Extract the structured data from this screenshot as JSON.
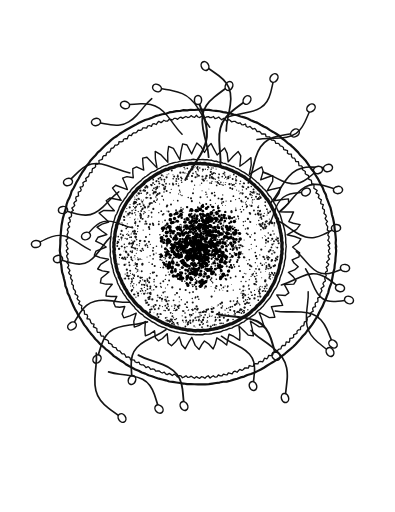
{
  "figure": {
    "kind": "line-drawing",
    "background_color": "#ffffff",
    "ink_color": "#111111",
    "canvas": {
      "width": 395,
      "height": 512
    },
    "caption": ""
  },
  "ovum": {
    "center": {
      "x": 198,
      "y": 247
    },
    "layers": [
      {
        "name": "zona-pellucida-outer-line",
        "label": "zona pellucida outer boundary",
        "radius": 138,
        "stroke_width": 2.2,
        "style": "smooth",
        "color": "#111111"
      },
      {
        "name": "zona-pellucida-inner-line",
        "label": "zona pellucida inner boundary",
        "radius": 131,
        "stroke_width": 1.3,
        "style": "slightly-wavy",
        "wobble_amplitude": 1.1,
        "wobble_lobes": 150,
        "color": "#111111"
      },
      {
        "name": "corona-radiata",
        "label": "corona radiata (jagged granulosa cells)",
        "radius": 103,
        "stroke_width": 1.4,
        "style": "sawtooth",
        "tooth_count": 46,
        "tooth_depth": 11,
        "color": "#111111"
      },
      {
        "name": "vitelline-membrane-outer",
        "label": "vitelline membrane outer line",
        "radius": 88,
        "stroke_width": 1.4,
        "style": "smooth",
        "color": "#111111"
      },
      {
        "name": "vitelline-membrane-thick",
        "label": "vitelline membrane thick band",
        "radius": 84,
        "stroke_width": 3.4,
        "style": "smooth",
        "color": "#000000"
      }
    ],
    "cytoplasm": {
      "name": "stippled-cytoplasm",
      "label": "stippled cytoplasm (yolk granules)",
      "radius": 81,
      "dot_count": 2600,
      "dot_color": "#141414",
      "dot_radius_min": 0.45,
      "dot_radius_max": 1.15
    },
    "nucleus": {
      "name": "dense-nucleus-core",
      "label": "dense nucleus core",
      "center": {
        "x": 200,
        "y": 245
      },
      "radius": 33,
      "dot_count": 1700,
      "dot_color": "#000000"
    }
  },
  "spermatozoa": {
    "count": 34,
    "head_label": "sperm head",
    "tail_label": "sperm tail",
    "head_fill": "#ffffff",
    "head_stroke": "#111111",
    "head_rx": 3.6,
    "head_ry": 4.6,
    "cells": [
      {
        "id": 1,
        "head": {
          "x": 198,
          "y": 100
        },
        "angle": -90,
        "tail_length": 86,
        "curl": 0.9,
        "thick": 2.1,
        "attached": true
      },
      {
        "id": 2,
        "head": {
          "x": 229,
          "y": 86
        },
        "angle": -62,
        "tail_length": 78,
        "curl": -1.1,
        "thick": 1.8,
        "attached": false
      },
      {
        "id": 3,
        "head": {
          "x": 205,
          "y": 66
        },
        "angle": -120,
        "tail_length": 72,
        "curl": 1.0,
        "thick": 1.7,
        "attached": false
      },
      {
        "id": 4,
        "head": {
          "x": 157,
          "y": 88
        },
        "angle": -152,
        "tail_length": 70,
        "curl": 0.7,
        "thick": 1.5,
        "attached": false
      },
      {
        "id": 5,
        "head": {
          "x": 247,
          "y": 100
        },
        "angle": -58,
        "tail_length": 76,
        "curl": -0.9,
        "thick": 1.9,
        "attached": true
      },
      {
        "id": 6,
        "head": {
          "x": 125,
          "y": 105
        },
        "angle": -163,
        "tail_length": 68,
        "curl": 0.8,
        "thick": 1.5,
        "attached": false
      },
      {
        "id": 7,
        "head": {
          "x": 96,
          "y": 122
        },
        "angle": 168,
        "tail_length": 64,
        "curl": -0.8,
        "thick": 1.5,
        "attached": false
      },
      {
        "id": 8,
        "head": {
          "x": 295,
          "y": 133
        },
        "angle": -35,
        "tail_length": 72,
        "curl": -1.0,
        "thick": 1.7,
        "attached": true
      },
      {
        "id": 9,
        "head": {
          "x": 311,
          "y": 108
        },
        "angle": -42,
        "tail_length": 66,
        "curl": 0.9,
        "thick": 1.5,
        "attached": false
      },
      {
        "id": 10,
        "head": {
          "x": 328,
          "y": 168
        },
        "angle": -20,
        "tail_length": 70,
        "curl": -0.9,
        "thick": 1.6,
        "attached": false
      },
      {
        "id": 11,
        "head": {
          "x": 318,
          "y": 170
        },
        "angle": -14,
        "tail_length": 58,
        "curl": 0.8,
        "thick": 1.6,
        "attached": true
      },
      {
        "id": 12,
        "head": {
          "x": 68,
          "y": 182
        },
        "angle": 160,
        "tail_length": 66,
        "curl": 0.9,
        "thick": 1.6,
        "attached": true
      },
      {
        "id": 13,
        "head": {
          "x": 63,
          "y": 210
        },
        "angle": 173,
        "tail_length": 62,
        "curl": -0.8,
        "thick": 1.6,
        "attached": true
      },
      {
        "id": 14,
        "head": {
          "x": 338,
          "y": 190
        },
        "angle": -8,
        "tail_length": 64,
        "curl": -0.9,
        "thick": 1.6,
        "attached": true
      },
      {
        "id": 15,
        "head": {
          "x": 36,
          "y": 244
        },
        "angle": 176,
        "tail_length": 58,
        "curl": 0.7,
        "thick": 1.4,
        "attached": false
      },
      {
        "id": 16,
        "head": {
          "x": 58,
          "y": 259
        },
        "angle": 170,
        "tail_length": 60,
        "curl": -0.9,
        "thick": 1.6,
        "attached": true
      },
      {
        "id": 17,
        "head": {
          "x": 336,
          "y": 228
        },
        "angle": -4,
        "tail_length": 62,
        "curl": 0.8,
        "thick": 1.6,
        "attached": true
      },
      {
        "id": 18,
        "head": {
          "x": 340,
          "y": 288
        },
        "angle": 14,
        "tail_length": 62,
        "curl": -0.8,
        "thick": 1.6,
        "attached": true
      },
      {
        "id": 19,
        "head": {
          "x": 349,
          "y": 300
        },
        "angle": 22,
        "tail_length": 56,
        "curl": 0.9,
        "thick": 1.5,
        "attached": false
      },
      {
        "id": 20,
        "head": {
          "x": 72,
          "y": 326
        },
        "angle": 146,
        "tail_length": 66,
        "curl": 0.9,
        "thick": 1.6,
        "attached": true
      },
      {
        "id": 21,
        "head": {
          "x": 333,
          "y": 344
        },
        "angle": 42,
        "tail_length": 70,
        "curl": -1.0,
        "thick": 1.6,
        "attached": false
      },
      {
        "id": 22,
        "head": {
          "x": 97,
          "y": 359
        },
        "angle": 132,
        "tail_length": 66,
        "curl": 0.9,
        "thick": 1.7,
        "attached": true
      },
      {
        "id": 23,
        "head": {
          "x": 276,
          "y": 356
        },
        "angle": 48,
        "tail_length": 76,
        "curl": -1.1,
        "thick": 2.0,
        "attached": true
      },
      {
        "id": 24,
        "head": {
          "x": 132,
          "y": 380
        },
        "angle": 112,
        "tail_length": 64,
        "curl": 0.9,
        "thick": 1.7,
        "attached": true
      },
      {
        "id": 25,
        "head": {
          "x": 253,
          "y": 386
        },
        "angle": 70,
        "tail_length": 62,
        "curl": -0.9,
        "thick": 1.6,
        "attached": true
      },
      {
        "id": 26,
        "head": {
          "x": 184,
          "y": 406
        },
        "angle": 60,
        "tail_length": 72,
        "curl": -1.0,
        "thick": 1.8,
        "attached": false
      },
      {
        "id": 27,
        "head": {
          "x": 159,
          "y": 409
        },
        "angle": 48,
        "tail_length": 66,
        "curl": -0.9,
        "thick": 1.7,
        "attached": false
      },
      {
        "id": 28,
        "head": {
          "x": 122,
          "y": 418
        },
        "angle": 58,
        "tail_length": 74,
        "curl": 0.9,
        "thick": 1.7,
        "attached": false
      },
      {
        "id": 29,
        "head": {
          "x": 285,
          "y": 398
        },
        "angle": 74,
        "tail_length": 80,
        "curl": -1.0,
        "thick": 1.7,
        "attached": false
      },
      {
        "id": 30,
        "head": {
          "x": 330,
          "y": 352
        },
        "angle": 60,
        "tail_length": 68,
        "curl": 0.8,
        "thick": 1.5,
        "attached": false
      },
      {
        "id": 31,
        "head": {
          "x": 86,
          "y": 236
        },
        "angle": 158,
        "tail_length": 50,
        "curl": 0.7,
        "thick": 1.4,
        "attached": false
      },
      {
        "id": 32,
        "head": {
          "x": 306,
          "y": 192
        },
        "angle": -30,
        "tail_length": 52,
        "curl": -0.7,
        "thick": 1.4,
        "attached": false
      },
      {
        "id": 33,
        "head": {
          "x": 274,
          "y": 78
        },
        "angle": -52,
        "tail_length": 64,
        "curl": 0.9,
        "thick": 1.5,
        "attached": false
      },
      {
        "id": 34,
        "head": {
          "x": 345,
          "y": 268
        },
        "angle": 6,
        "tail_length": 54,
        "curl": 0.8,
        "thick": 1.5,
        "attached": false
      }
    ]
  }
}
